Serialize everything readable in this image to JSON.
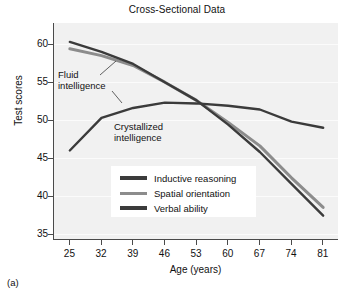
{
  "figure": {
    "panel_label": "(a)"
  },
  "chart_data": {
    "type": "line",
    "title": "Cross-Sectional Data",
    "xlabel": "Age (years)",
    "ylabel": "Test scores",
    "x": [
      25,
      32,
      39,
      46,
      53,
      60,
      67,
      74,
      81
    ],
    "xtick_labels": [
      "25",
      "32",
      "39",
      "46",
      "53",
      "60",
      "67",
      "74",
      "81"
    ],
    "ytick_labels": [
      "35",
      "40",
      "45",
      "50",
      "55",
      "60"
    ],
    "yticks": [
      35,
      40,
      45,
      50,
      55,
      60
    ],
    "xlim": [
      21.5,
      84.5
    ],
    "ylim": [
      33.2,
      61.8
    ],
    "grid": true,
    "legend_position": "center",
    "series": [
      {
        "name": "Inductive reasoning",
        "color": "#3b3b3b",
        "values": [
          59.3,
          58.0,
          56.4,
          54.0,
          51.6,
          48.4,
          44.8,
          40.6,
          36.4
        ]
      },
      {
        "name": "Spatial orientation",
        "color": "#8c8c8c",
        "values": [
          58.4,
          57.5,
          56.2,
          54.0,
          51.6,
          48.7,
          45.6,
          41.4,
          37.5
        ]
      },
      {
        "name": "Verbal ability",
        "color": "#3b3b3b",
        "values": [
          45.0,
          49.3,
          50.6,
          51.3,
          51.2,
          50.9,
          50.4,
          48.8,
          48.0
        ]
      }
    ],
    "annotations": [
      {
        "text_line1": "Fluid",
        "text_line2": "intelligence"
      },
      {
        "text_line1": "Crystallized",
        "text_line2": "intelligence"
      }
    ]
  }
}
